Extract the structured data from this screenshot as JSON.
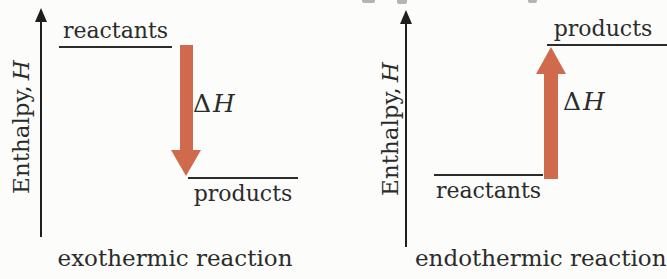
{
  "figure": {
    "background_color": "#fcfcfa",
    "ink_color": "#2b2b2b",
    "arrow_color": "#cf6a4c",
    "diagrams": [
      {
        "caption": "exothermic reaction",
        "axis": {
          "label_text": "Enthalpy,",
          "label_symbol": "H"
        },
        "upper_level": {
          "label": "reactants",
          "enthalpy": "high"
        },
        "lower_level": {
          "label": "products",
          "enthalpy": "low"
        },
        "arrow": {
          "direction": "down",
          "label_delta": "Δ",
          "label_symbol": "H"
        }
      },
      {
        "caption": "endothermic reaction",
        "axis": {
          "label_text": "Enthalpy,",
          "label_symbol": "H"
        },
        "upper_level": {
          "label": "products",
          "enthalpy": "high"
        },
        "lower_level": {
          "label": "reactants",
          "enthalpy": "low"
        },
        "arrow": {
          "direction": "up",
          "label_delta": "Δ",
          "label_symbol": "H"
        }
      }
    ]
  }
}
